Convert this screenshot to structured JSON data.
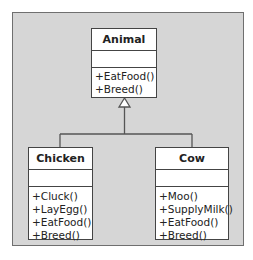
{
  "diagram": {
    "type": "uml-class-diagram",
    "relationship": "inheritance",
    "colors": {
      "background": "#d6d6d6",
      "frame_border": "#6f6f6f",
      "box_fill": "#ffffff",
      "box_border": "#444444",
      "connector": "#555555"
    },
    "parent": {
      "name": "Animal",
      "attributes": [],
      "operations": [
        "+EatFood()",
        "+Breed()"
      ]
    },
    "children": [
      {
        "name": "Chicken",
        "attributes": [],
        "operations": [
          "+Cluck()",
          "+LayEgg()",
          "+EatFood()",
          "+Breed()"
        ]
      },
      {
        "name": "Cow",
        "attributes": [],
        "operations": [
          "+Moo()",
          "+SupplyMilk()",
          "+EatFood()",
          "+Breed()"
        ]
      }
    ]
  }
}
